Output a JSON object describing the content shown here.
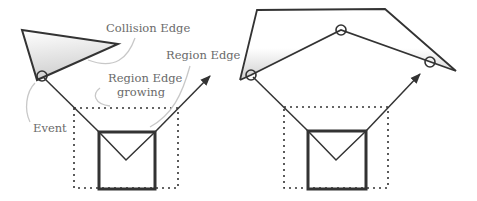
{
  "diagram": {
    "colors": {
      "stroke": "#333333",
      "label": "#6a6a6a",
      "leader": "#c8c8c8",
      "fill_light": "#ffffff",
      "fill_dark": "#d0d0d0"
    },
    "left_panel": {
      "labels": {
        "collision_edge": "Collision Edge",
        "region_edge": "Region Edge",
        "region_edge_growing_line1": "Region Edge",
        "region_edge_growing_line2": "growing",
        "event": "Event"
      },
      "obstacle": "triangle",
      "event_markers": 1
    },
    "right_panel": {
      "obstacle": "pentagon",
      "event_markers": 3
    }
  }
}
